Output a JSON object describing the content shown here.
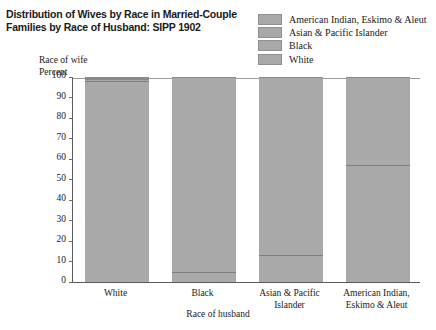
{
  "title": {
    "line1": "Distribution of Wives by Race in Married-Couple",
    "line2": "Families by Race of Husband: SIPP 1902"
  },
  "axis_captions": {
    "y_group": "Race of wife",
    "y_unit": "Percent",
    "x_title": "Race of husband"
  },
  "legend": {
    "items": [
      {
        "label": "American Indian, Eskimo & Aleut",
        "color": "#a9a9a9"
      },
      {
        "label": "Asian & Pacific Islander",
        "color": "#a9a9a9"
      },
      {
        "label": "Black",
        "color": "#a9a9a9"
      },
      {
        "label": "White",
        "color": "#a9a9a9"
      }
    ]
  },
  "yaxis": {
    "ticks": [
      "100",
      "90",
      "80",
      "70",
      "60",
      "50",
      "40",
      "30",
      "20",
      "10",
      "0"
    ]
  },
  "chart_data": {
    "type": "bar",
    "subtype": "stacked-100-percent",
    "title": "Distribution of Wives by Race in Married-Couple Families by Race of Husband: SIPP 1902",
    "xlabel": "Race of husband",
    "ylabel": "Percent",
    "ylegend_title": "Race of wife",
    "ylim": [
      0,
      100
    ],
    "yticks": [
      0,
      10,
      20,
      30,
      40,
      50,
      60,
      70,
      80,
      90,
      100
    ],
    "grid": false,
    "legend_position": "top-right",
    "categories": [
      "White",
      "Black",
      "Asian & Pacific Islander",
      "American Indian, Eskimo & Aleut"
    ],
    "series": [
      {
        "name": "White",
        "values": [
          98,
          5,
          13,
          57
        ]
      },
      {
        "name": "Black",
        "values": [
          0.5,
          95,
          0,
          0
        ]
      },
      {
        "name": "Asian & Pacific Islander",
        "values": [
          1,
          0,
          87,
          0
        ]
      },
      {
        "name": "American Indian, Eskimo & Aleut",
        "values": [
          0.5,
          0,
          0,
          43
        ]
      }
    ],
    "bar_color": "#a9a9a9"
  },
  "bars": [
    {
      "label_lines": [
        "White"
      ],
      "segments": [
        {
          "series": "White",
          "value": 98,
          "start": 0,
          "end": 98
        },
        {
          "series": "Asian & Pacific Islander",
          "value": 1,
          "start": 98,
          "end": 99
        },
        {
          "series": "Black",
          "value": 0.5,
          "start": 99,
          "end": 99.5
        },
        {
          "series": "American Indian, Eskimo & Aleut",
          "value": 0.5,
          "start": 99.5,
          "end": 100
        }
      ]
    },
    {
      "label_lines": [
        "Black"
      ],
      "segments": [
        {
          "series": "White",
          "value": 5,
          "start": 0,
          "end": 5
        },
        {
          "series": "Black",
          "value": 95,
          "start": 5,
          "end": 100
        }
      ]
    },
    {
      "label_lines": [
        "Asian & Pacific",
        "Islander"
      ],
      "segments": [
        {
          "series": "White",
          "value": 13,
          "start": 0,
          "end": 13
        },
        {
          "series": "Asian & Pacific Islander",
          "value": 87,
          "start": 13,
          "end": 100
        }
      ]
    },
    {
      "label_lines": [
        "American Indian,",
        "Eskimo & Aleut"
      ],
      "segments": [
        {
          "series": "White",
          "value": 57,
          "start": 0,
          "end": 57
        },
        {
          "series": "American Indian, Eskimo & Aleut",
          "value": 43,
          "start": 57,
          "end": 100
        }
      ]
    }
  ]
}
